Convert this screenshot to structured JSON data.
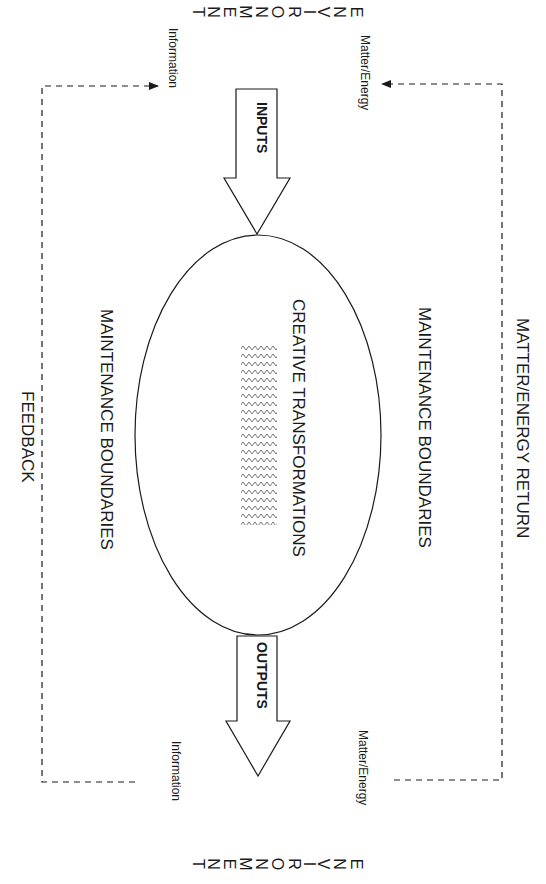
{
  "diagram": {
    "environment_label": "ENVIRONMENT",
    "environment_letters": [
      "E",
      "N",
      "V",
      "I",
      "R",
      "O",
      "N",
      "M",
      "E",
      "N",
      "T"
    ],
    "inputs_label": "INPUTS",
    "outputs_label": "OUTPUTS",
    "core_label": "CREATIVE TRANSFORMATIONS",
    "boundary_label_right": "MAINTENANCE BOUNDARIES",
    "boundary_label_left": "MAINTENANCE BOUNDARIES",
    "return_loop_label": "MATTER/ENERGY RETURN",
    "feedback_loop_label": "FEEDBACK",
    "top_left_flow_label": "Information",
    "top_right_flow_label": "Matter/Energy",
    "bottom_left_flow_label": "Information",
    "bottom_right_flow_label": "Matter/Energy"
  },
  "colors": {
    "stroke": "#1a1a1a",
    "background": "#ffffff",
    "pattern": "#555555"
  }
}
